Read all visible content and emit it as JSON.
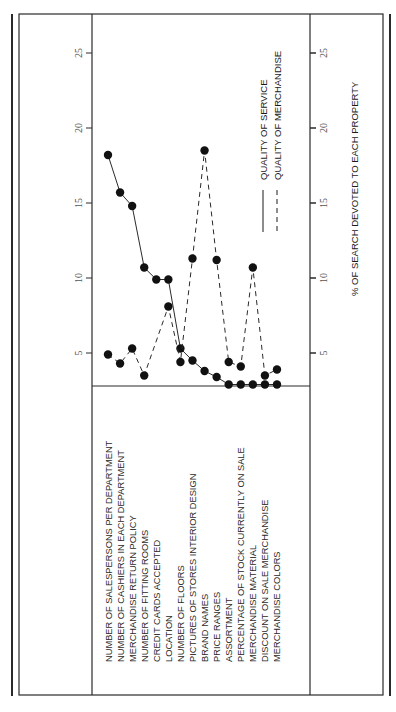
{
  "chart_data": {
    "type": "line",
    "orientation": "rotated-90-clockwise",
    "title": "",
    "xlabel": "",
    "ylabel": "% OF SEARCH DEVOTED TO EACH PROPERTY",
    "ylim": [
      2,
      27
    ],
    "yticks": [
      5,
      10,
      15,
      20,
      25
    ],
    "grid": false,
    "legend_position": "upper-right (rotated)",
    "categories": [
      "NUMBER OF SALESPERSONS PER DEPARTMENT",
      "NUMBER OF CASHIERS IN EACH DEPARTMENT",
      "MERCHANDISE RETURN POLICY",
      "NUMBER OF FITTING ROOMS",
      "CREDIT CARDS ACCEPTED",
      "LOCATION",
      "NUMBER OF FLOORS",
      "PICTURES OF STORES INTERIOR DESIGN",
      "BRAND NAMES",
      "PRICE RANGES",
      "ASSORTMENT",
      "PERCENTAGE OF STOCK CURRENTLY ON SALE",
      "MERCHANDISE MATERIAL",
      "DISCOUNT ON SALE MERCHANDISE",
      "MERCHANDISE COLORS"
    ],
    "series": [
      {
        "name": "QUALITY OF SERVICE",
        "line_style": "solid",
        "values": [
          18.2,
          15.7,
          14.8,
          10.7,
          9.9,
          9.9,
          5.3,
          4.5,
          3.8,
          3.4,
          2.9,
          2.9,
          2.9,
          2.9,
          2.9
        ]
      },
      {
        "name": "QUALITY OF MERCHANDISE",
        "line_style": "dashed",
        "values": [
          4.9,
          4.3,
          5.3,
          3.5,
          null,
          8.1,
          4.4,
          11.3,
          18.5,
          11.2,
          4.4,
          4.1,
          10.7,
          3.5,
          3.9
        ]
      }
    ]
  },
  "legend": {
    "service_label": "QUALITY OF SERVICE",
    "merchandise_label": "QUALITY OF MERCHANDISE"
  },
  "axis": {
    "title": "% OF SEARCH DEVOTED TO EACH PROPERTY",
    "tick_labels": [
      "5",
      "10",
      "15",
      "20",
      "25"
    ]
  },
  "colors": {
    "ink": "#1a1a1a",
    "frame": "#2a2a2a",
    "background": "#ffffff"
  }
}
